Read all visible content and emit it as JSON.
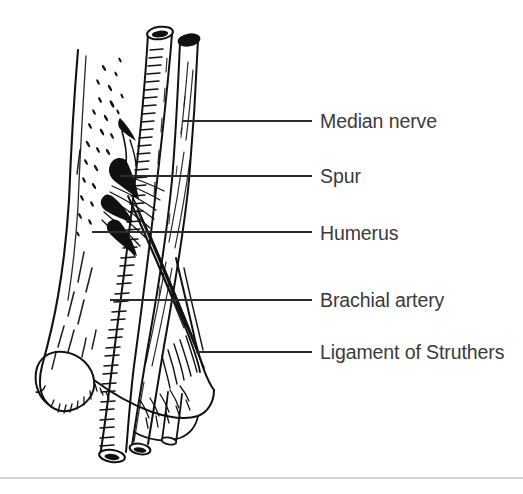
{
  "figure": {
    "kind": "anatomical-line-drawing",
    "background_color": "#ffffff",
    "ink_color": "#111111",
    "label_color": "#3a3a3a",
    "leader_color": "#2b2b2b",
    "footer_rule_color": "#a9a9a9"
  },
  "labels": [
    {
      "id": "median-nerve",
      "text": "Median nerve",
      "leader": {
        "x1": 183,
        "y1": 121,
        "x2": 312,
        "y2": 121
      },
      "text_x": 320,
      "text_y": 128
    },
    {
      "id": "spur",
      "text": "Spur",
      "leader": {
        "x1": 120,
        "y1": 176,
        "x2": 312,
        "y2": 176
      },
      "text_x": 320,
      "text_y": 183
    },
    {
      "id": "humerus",
      "text": "Humerus",
      "leader": {
        "x1": 92,
        "y1": 232,
        "x2": 312,
        "y2": 232
      },
      "text_x": 320,
      "text_y": 240
    },
    {
      "id": "brachial-artery",
      "text": "Brachial artery",
      "leader": {
        "x1": 110,
        "y1": 300,
        "x2": 312,
        "y2": 300
      },
      "text_x": 320,
      "text_y": 307
    },
    {
      "id": "ligament-of-struthers",
      "text": "Ligament of Struthers",
      "leader": {
        "x1": 196,
        "y1": 352,
        "x2": 312,
        "y2": 352
      },
      "text_x": 320,
      "text_y": 359
    }
  ],
  "footer_rule": {
    "x1": 0,
    "y1": 478,
    "x2": 523,
    "y2": 478
  }
}
